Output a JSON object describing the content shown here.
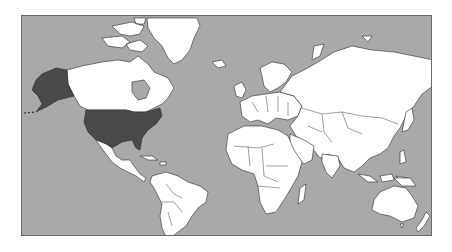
{
  "map": {
    "projection": "Mercator world map",
    "colors": {
      "ocean": "#a9a9a9",
      "land": "#ffffff",
      "highlighted": "#4a4a4a",
      "border": "#2a2a2a",
      "frame": "#6a6a6a"
    },
    "highlighted_countries": [
      "United States",
      "Alaska (United States)"
    ],
    "regions": [
      "North America",
      "Greenland",
      "South America",
      "Europe",
      "Africa",
      "Asia",
      "Australia",
      "New Zealand"
    ]
  }
}
